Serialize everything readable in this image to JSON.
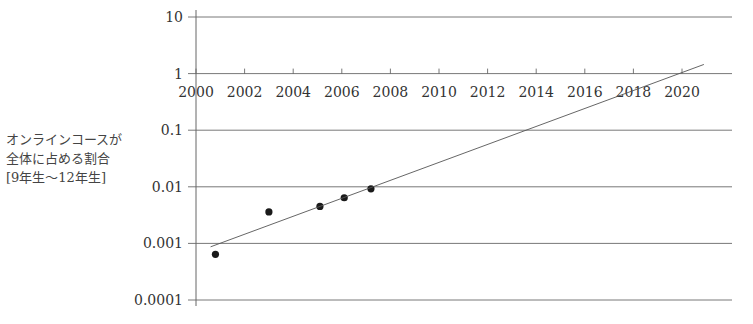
{
  "chart_data": {
    "type": "scatter",
    "title": "",
    "xlabel": "",
    "ylabel": "オンラインコースが全体に占める割合 [9年生～12年生]",
    "ylabel_lines": [
      "オンラインコースが",
      "全体に占める割合",
      "[9年生～12年生]"
    ],
    "yscale": "log",
    "ylim": [
      0.0001,
      10
    ],
    "xlim": [
      2000,
      2021
    ],
    "y_ticks": [
      "10",
      "1",
      "0.1",
      "0.01",
      "0.001",
      "0.0001"
    ],
    "y_tick_values": [
      10,
      1,
      0.1,
      0.01,
      0.001,
      0.0001
    ],
    "x_ticks": [
      "2000",
      "2002",
      "2004",
      "2006",
      "2008",
      "2010",
      "2012",
      "2014",
      "2016",
      "2018",
      "2020"
    ],
    "x_tick_values": [
      2000,
      2002,
      2004,
      2006,
      2008,
      2010,
      2012,
      2014,
      2016,
      2018,
      2020
    ],
    "grid": true,
    "series": [
      {
        "name": "data",
        "type": "scatter",
        "x": [
          2000.8,
          2003.0,
          2005.1,
          2006.1,
          2007.2
        ],
        "y": [
          0.00064,
          0.0036,
          0.0045,
          0.0064,
          0.0092
        ]
      },
      {
        "name": "trend",
        "type": "line",
        "x": [
          2000.6,
          2020.9
        ],
        "y": [
          0.00087,
          1.45
        ]
      }
    ]
  },
  "colors": {
    "grid": "#555555",
    "marker": "#1a1a1a",
    "trend": "#555555",
    "text": "#333333"
  }
}
